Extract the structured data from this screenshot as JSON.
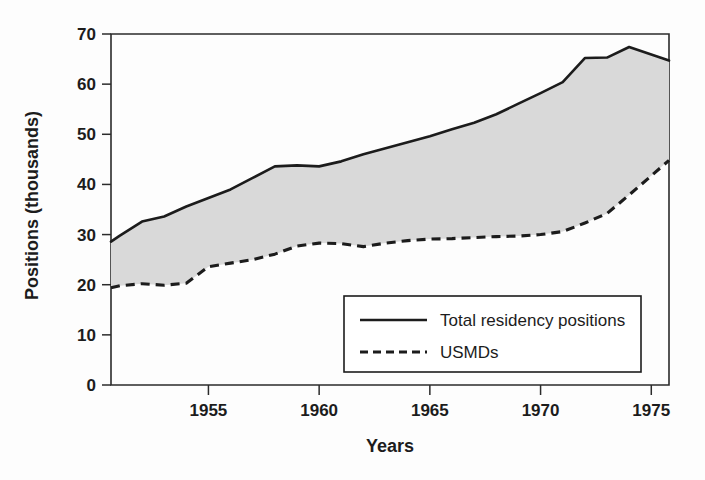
{
  "chart_data": {
    "type": "area",
    "title": "",
    "xlabel": "Years",
    "ylabel": "Positions (thousands)",
    "xlim": [
      1950.6,
      1975.8
    ],
    "ylim": [
      0,
      70
    ],
    "grid": false,
    "legend_position": "bottom-right",
    "x_ticks": [
      "1955",
      "1960",
      "1965",
      "1970",
      "1975"
    ],
    "x_tick_values": [
      1955,
      1960,
      1965,
      1970,
      1975
    ],
    "y_ticks": [
      "0",
      "10",
      "20",
      "30",
      "40",
      "50",
      "60",
      "70"
    ],
    "y_tick_values": [
      0,
      10,
      20,
      30,
      40,
      50,
      60,
      70
    ],
    "x": [
      1950.6,
      1951,
      1952,
      1953,
      1954,
      1955,
      1956,
      1957,
      1958,
      1959,
      1960,
      1961,
      1962,
      1963,
      1964,
      1965,
      1966,
      1967,
      1968,
      1969,
      1970,
      1971,
      1972,
      1973,
      1974,
      1975.8
    ],
    "series": [
      {
        "name": "Total residency positions",
        "style": "solid",
        "color": "#1c1c1c",
        "values": [
          28.6,
          29.8,
          32.6,
          33.6,
          35.6,
          37.3,
          39.0,
          41.3,
          43.6,
          43.8,
          43.6,
          44.6,
          46.0,
          47.2,
          48.4,
          49.6,
          51.0,
          52.3,
          54.0,
          56.1,
          58.2,
          60.4,
          65.2,
          65.3,
          67.4,
          64.7
        ]
      },
      {
        "name": "USMDs",
        "style": "dashed",
        "color": "#1c1c1c",
        "values": [
          19.4,
          19.8,
          20.2,
          19.9,
          20.3,
          23.6,
          24.3,
          25.0,
          26.1,
          27.7,
          28.3,
          28.2,
          27.6,
          28.3,
          28.8,
          29.1,
          29.2,
          29.4,
          29.6,
          29.7,
          30.0,
          30.6,
          32.3,
          34.2,
          37.9,
          44.8
        ]
      }
    ],
    "area_fill": {
      "between": [
        "Total residency positions",
        "USMDs"
      ],
      "color": "#d9d9d9"
    }
  },
  "legend": {
    "items": [
      {
        "label": "Total residency positions",
        "style": "solid"
      },
      {
        "label": "USMDs",
        "style": "dashed"
      }
    ]
  },
  "axes": {
    "y_title": "Positions (thousands)",
    "x_title": "Years"
  }
}
